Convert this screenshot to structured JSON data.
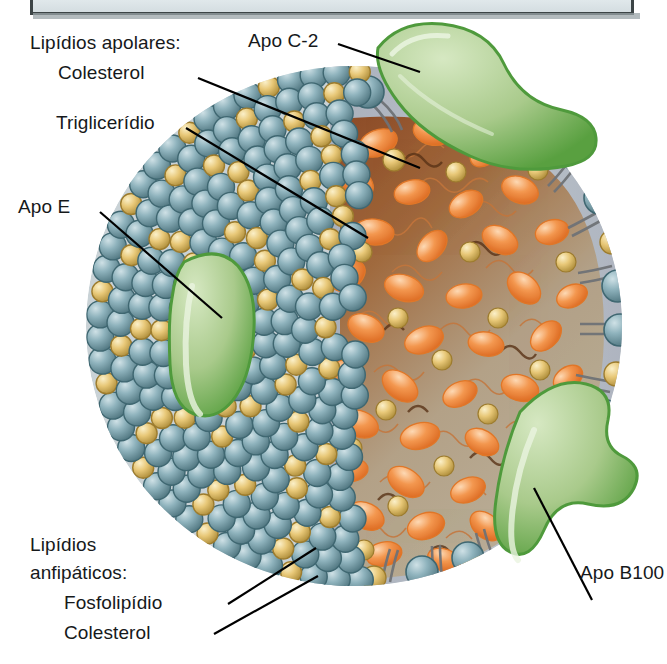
{
  "figure": {
    "title_bar_text": ""
  },
  "labels": {
    "apolar_group": "Lipídios apolares:",
    "apolar_item_1": "Colesterol",
    "apolar_item_2": "Triglicerídio",
    "apo_e": "Apo E",
    "apo_c2": "Apo C-2",
    "apo_b100": "Apo B100",
    "amphipathic_group_line1": "Lipídios",
    "amphipathic_group_line2": "anfipáticos:",
    "amphipathic_item_1": "Fosfolipídio",
    "amphipathic_item_2": "Colesterol"
  },
  "colors": {
    "phospholipid_head": "#7fa7b2",
    "phospholipid_head_dark": "#4d7680",
    "phospholipid_tail": "#6f7276",
    "cholesterol": "#e7c878",
    "cholesterol_dark": "#b9973f",
    "triglyceride": "#f08a43",
    "triglyceride_light": "#f7b67e",
    "core_background_dark": "#8e4c27",
    "core_background_light": "#b0a089",
    "apoprotein_green": "#a8c98a",
    "apoprotein_green_dark": "#4f9a3c",
    "membrane_band": "#b6bcc6",
    "label_text": "#16191b",
    "leader_line": "#000000",
    "topbar_fill": "#e2e9ec",
    "topbar_border": "#3c4446"
  },
  "legend_notes": {
    "core": "triglyceride and cholesteryl-ester rich apolar core",
    "surface": "phospholipid and cholesterol amphipathic monolayer",
    "proteins": "apolipoproteins embedded in surface monolayer"
  }
}
